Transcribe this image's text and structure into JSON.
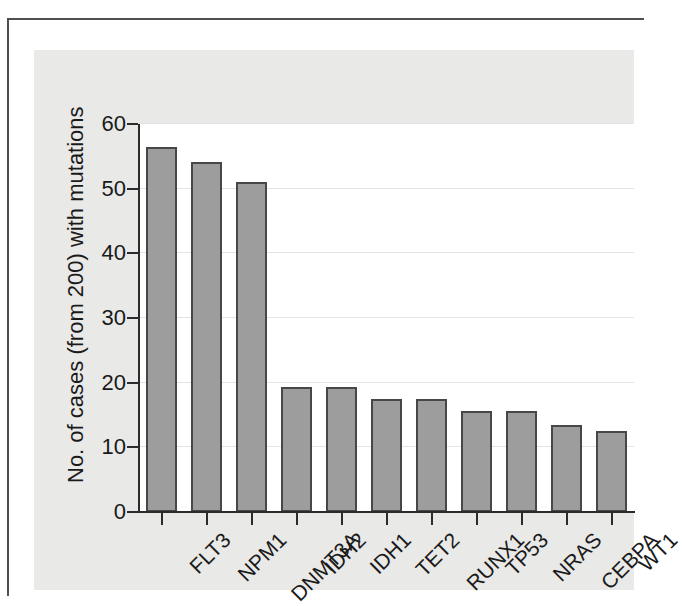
{
  "figure": {
    "panel_background": "#e9e9e7",
    "plot_background": "#ffffff",
    "frame_color": "#4d4f52"
  },
  "chart_data": {
    "type": "bar",
    "title": "",
    "xlabel": "",
    "ylabel": "No. of cases (from 200) with mutations",
    "ylim": [
      0,
      60
    ],
    "yticks": [
      0,
      10,
      20,
      30,
      40,
      50,
      60
    ],
    "ytick_labels": [
      "0",
      "10",
      "20",
      "30",
      "40",
      "50",
      "60"
    ],
    "grid": true,
    "grid_axis": "y",
    "legend": null,
    "bar_fill_color": "#9d9d9d",
    "bar_edge_color": "#474747",
    "categories": [
      "FLT3",
      "NPM1",
      "DNMT3A",
      "IDH2",
      "IDH1",
      "TET2",
      "RUNX1",
      "TP53",
      "NRAS",
      "CEBPA",
      "WT1"
    ],
    "values": [
      56.4,
      54.1,
      51.1,
      19.4,
      19.4,
      17.5,
      17.5,
      15.6,
      15.6,
      13.5,
      12.6
    ]
  }
}
